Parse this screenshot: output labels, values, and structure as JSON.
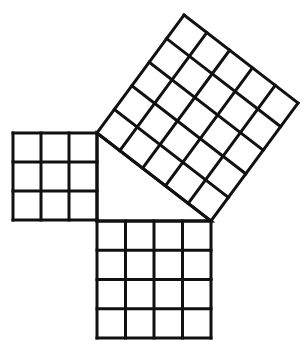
{
  "diagram": {
    "stroke_color": "#111111",
    "background": "#ffffff",
    "squares": [
      {
        "name": "left-square",
        "grid_size": 3,
        "origin": [
          13,
          133
        ],
        "u": [
          84,
          0
        ],
        "v": [
          0,
          87
        ]
      },
      {
        "name": "bottom-square",
        "grid_size": 4,
        "origin": [
          97,
          221
        ],
        "u": [
          114,
          0
        ],
        "v": [
          0,
          117
        ]
      },
      {
        "name": "hypotenuse-square",
        "grid_size": 5,
        "origin": [
          97,
          133
        ],
        "u": [
          114,
          88
        ],
        "v": [
          87,
          -118
        ]
      }
    ],
    "triangle": {
      "vertices": [
        [
          97,
          133
        ],
        [
          97,
          221
        ],
        [
          211,
          221
        ]
      ]
    }
  }
}
